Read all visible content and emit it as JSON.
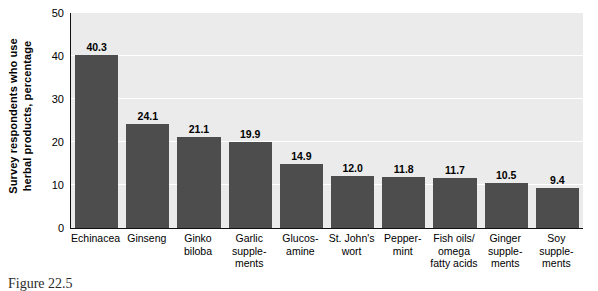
{
  "chart_data": {
    "type": "bar",
    "title": "",
    "xlabel": "",
    "ylabel": "Survey respondents who use herbal products, percentage",
    "ylim": [
      0,
      50
    ],
    "yticks": [
      0,
      10,
      20,
      30,
      40,
      50
    ],
    "grid": true,
    "legend": "none",
    "bar_color": "#4d4d4d",
    "plot_background": "#ebebeb",
    "gridline_color": "#ffffff",
    "axis_color": "#111111",
    "categories": [
      "Echinacea",
      "Ginseng",
      "Ginko biloba",
      "Garlic supplements",
      "Glucosamine",
      "St. John's wort",
      "Peppermint",
      "Fish oils/ omega fatty acids",
      "Ginger supplements",
      "Soy supplements"
    ],
    "category_lines": [
      [
        "Echinacea"
      ],
      [
        "Ginseng"
      ],
      [
        "Ginko",
        "biloba"
      ],
      [
        "Garlic",
        "supple-",
        "ments"
      ],
      [
        "Glucos-",
        "amine"
      ],
      [
        "St. John's",
        "wort"
      ],
      [
        "Pepper-",
        "mint"
      ],
      [
        "Fish oils/",
        "omega",
        "fatty acids"
      ],
      [
        "Ginger",
        "supple-",
        "ments"
      ],
      [
        "Soy",
        "supple-",
        "ments"
      ]
    ],
    "values": [
      40.3,
      24.1,
      21.1,
      19.9,
      14.9,
      12.0,
      11.8,
      11.7,
      10.5,
      9.4
    ],
    "value_labels": [
      "40.3",
      "24.1",
      "21.1",
      "19.9",
      "14.9",
      "12.0",
      "11.8",
      "11.7",
      "10.5",
      "9.4"
    ]
  },
  "y_axis": {
    "title_lines": [
      "Survey respondents who use",
      "herbal products, percentage"
    ],
    "tick_labels": [
      "50",
      "40",
      "30",
      "20",
      "10",
      "0"
    ]
  },
  "caption": {
    "label": "Figure 22.5",
    "text": ""
  }
}
